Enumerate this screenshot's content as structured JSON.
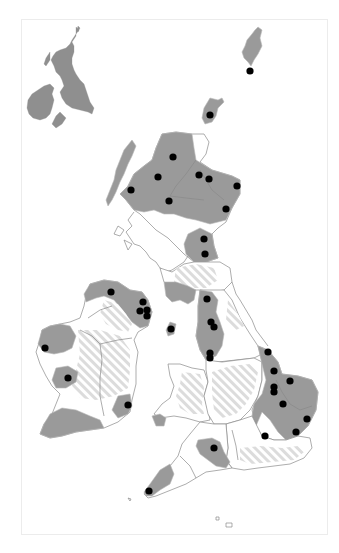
{
  "map": {
    "title": "",
    "frame": {
      "x": 21,
      "y": 19,
      "width": 307,
      "height": 516,
      "border_color": "#ececec"
    },
    "colors": {
      "background": "#ffffff",
      "land_outline": "#8a8a8a",
      "highlighted_region": "#9a9a9a",
      "internal_boundary": "#b8b8b8",
      "hatched_region_stripe": "#dcdcdc",
      "inset_map": "#8f8f8f",
      "marker": "#000000"
    },
    "inset": {
      "description": "Locator map of British Isles",
      "position": "top-left"
    },
    "legend": {
      "solid_grey": "highlighted regions",
      "hatched": "partially covered regions",
      "white": "other regions",
      "black_dot": "location marker"
    },
    "markers": [
      {
        "id": 1,
        "area": "Shetland",
        "x": 250,
        "y": 71
      },
      {
        "id": 2,
        "area": "Orkney",
        "x": 210,
        "y": 115
      },
      {
        "id": 3,
        "area": "Sutherland",
        "x": 173,
        "y": 157
      },
      {
        "id": 4,
        "area": "Ross",
        "x": 158,
        "y": 177
      },
      {
        "id": 5,
        "area": "Skye/Lochalsh",
        "x": 131,
        "y": 190
      },
      {
        "id": 6,
        "area": "Moray 1",
        "x": 199,
        "y": 175
      },
      {
        "id": 7,
        "area": "Moray 2",
        "x": 209,
        "y": 179
      },
      {
        "id": 8,
        "area": "Aberdeenshire coast",
        "x": 237,
        "y": 186
      },
      {
        "id": 9,
        "area": "Highland central",
        "x": 169,
        "y": 201
      },
      {
        "id": 10,
        "area": "Angus",
        "x": 226,
        "y": 209
      },
      {
        "id": 11,
        "area": "Fife/Lothian",
        "x": 204,
        "y": 239
      },
      {
        "id": 12,
        "area": "Borders",
        "x": 205,
        "y": 254
      },
      {
        "id": 13,
        "area": "Cumbria",
        "x": 207,
        "y": 299
      },
      {
        "id": 14,
        "area": "Lancashire 1",
        "x": 211,
        "y": 322
      },
      {
        "id": 15,
        "area": "Lancashire 2",
        "x": 214,
        "y": 327
      },
      {
        "id": 16,
        "area": "Isle of Man",
        "x": 171,
        "y": 329
      },
      {
        "id": 17,
        "area": "Cheshire 1",
        "x": 210,
        "y": 353
      },
      {
        "id": 18,
        "area": "Cheshire 2",
        "x": 210,
        "y": 358
      },
      {
        "id": 19,
        "area": "Donegal",
        "x": 111,
        "y": 292
      },
      {
        "id": 20,
        "area": "Antrim 1",
        "x": 143,
        "y": 302
      },
      {
        "id": 21,
        "area": "Antrim 2",
        "x": 140,
        "y": 311
      },
      {
        "id": 22,
        "area": "Down 1",
        "x": 147,
        "y": 310
      },
      {
        "id": 23,
        "area": "Down 2",
        "x": 147,
        "y": 316
      },
      {
        "id": 24,
        "area": "Mayo",
        "x": 45,
        "y": 348
      },
      {
        "id": 25,
        "area": "Galway/Clare",
        "x": 68,
        "y": 378
      },
      {
        "id": 26,
        "area": "Wexford",
        "x": 128,
        "y": 405
      },
      {
        "id": 27,
        "area": "Lincolnshire north",
        "x": 268,
        "y": 352
      },
      {
        "id": 28,
        "area": "Lincolnshire",
        "x": 274,
        "y": 371
      },
      {
        "id": 29,
        "area": "Norfolk north",
        "x": 290,
        "y": 381
      },
      {
        "id": 30,
        "area": "Lincolnshire south 1",
        "x": 274,
        "y": 387
      },
      {
        "id": 31,
        "area": "Lincolnshire south 2",
        "x": 274,
        "y": 392
      },
      {
        "id": 32,
        "area": "Cambridgeshire",
        "x": 283,
        "y": 404
      },
      {
        "id": 33,
        "area": "Suffolk",
        "x": 307,
        "y": 419
      },
      {
        "id": 34,
        "area": "Essex",
        "x": 296,
        "y": 432
      },
      {
        "id": 35,
        "area": "Bedfordshire",
        "x": 265,
        "y": 436
      },
      {
        "id": 36,
        "area": "Hertfordshire",
        "x": 293,
        "y": 434
      },
      {
        "id": 37,
        "area": "Somerset",
        "x": 214,
        "y": 448
      },
      {
        "id": 38,
        "area": "Cornwall",
        "x": 149,
        "y": 491
      }
    ]
  }
}
